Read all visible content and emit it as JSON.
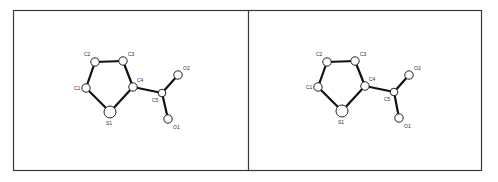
{
  "figure": {
    "type": "stereo-pair molecular structure",
    "panels": [
      {
        "id": "left",
        "atoms": [
          {
            "name": "C1",
            "x": 86,
            "y": 88,
            "r": 4.2,
            "lx": 74,
            "ly": 90
          },
          {
            "name": "C2",
            "x": 95,
            "y": 62,
            "r": 4.2,
            "lx": 84,
            "ly": 56
          },
          {
            "name": "C3",
            "x": 123,
            "y": 61,
            "r": 4.2,
            "lx": 128,
            "ly": 56
          },
          {
            "name": "C4",
            "x": 133,
            "y": 87,
            "r": 4.2,
            "lx": 137,
            "ly": 82
          },
          {
            "name": "S1",
            "x": 110,
            "y": 112,
            "r": 6,
            "lx": 106,
            "ly": 125
          },
          {
            "name": "C5",
            "x": 162,
            "y": 93,
            "r": 3.8,
            "lx": 152,
            "ly": 102
          },
          {
            "name": "O2",
            "x": 178,
            "y": 75,
            "r": 4.2,
            "lx": 183,
            "ly": 70
          },
          {
            "name": "O1",
            "x": 168,
            "y": 119,
            "r": 4.2,
            "lx": 173,
            "ly": 129
          }
        ]
      },
      {
        "id": "right",
        "atoms": [
          {
            "name": "C1",
            "x": 318,
            "y": 87,
            "r": 4.2,
            "lx": 306,
            "ly": 89
          },
          {
            "name": "C2",
            "x": 327,
            "y": 62,
            "r": 4.2,
            "lx": 316,
            "ly": 56
          },
          {
            "name": "C3",
            "x": 355,
            "y": 61,
            "r": 4.2,
            "lx": 360,
            "ly": 56
          },
          {
            "name": "C4",
            "x": 365,
            "y": 86,
            "r": 4.2,
            "lx": 369,
            "ly": 81
          },
          {
            "name": "S1",
            "x": 342,
            "y": 111,
            "r": 6,
            "lx": 338,
            "ly": 124
          },
          {
            "name": "C5",
            "x": 394,
            "y": 92,
            "r": 3.8,
            "lx": 384,
            "ly": 101
          },
          {
            "name": "O2",
            "x": 409,
            "y": 75,
            "r": 4.2,
            "lx": 414,
            "ly": 70
          },
          {
            "name": "O1",
            "x": 399,
            "y": 118,
            "r": 4.2,
            "lx": 404,
            "ly": 128
          }
        ]
      }
    ],
    "bonds": [
      [
        "C1",
        "C2"
      ],
      [
        "C2",
        "C3"
      ],
      [
        "C3",
        "C4"
      ],
      [
        "C4",
        "S1"
      ],
      [
        "S1",
        "C1"
      ],
      [
        "C4",
        "C5"
      ],
      [
        "C5",
        "O2"
      ],
      [
        "C5",
        "O1"
      ]
    ]
  }
}
